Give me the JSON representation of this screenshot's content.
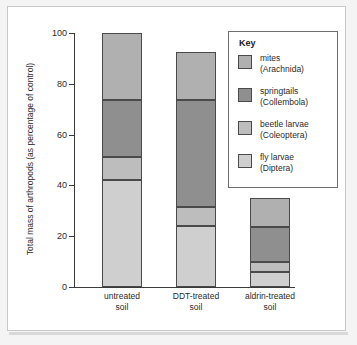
{
  "chart_data": {
    "type": "bar",
    "stacked": true,
    "title": "",
    "xlabel": "",
    "ylabel": "Total mass of arthropods (as percentage of control)",
    "ylim": [
      0,
      100
    ],
    "yticks": [
      0,
      20,
      40,
      60,
      80,
      100
    ],
    "ytick_labels": [
      "0",
      "20",
      "40",
      "60",
      "80",
      "100"
    ],
    "grid": false,
    "legend_position": "inside-top-right",
    "legend_title": "Key",
    "categories": [
      "untreated soil",
      "DDT-treated soil",
      "aldrin-treated soil"
    ],
    "category_lines": [
      [
        "untreated",
        "soil"
      ],
      [
        "DDT-treated",
        "soil"
      ],
      [
        "aldrin-treated",
        "soil"
      ]
    ],
    "stack_order_bottom_to_top": [
      "fly larvae (Diptera)",
      "beetle larvae (Coleoptera)",
      "springtails (Collembola)",
      "mites (Arachnida)"
    ],
    "series": [
      {
        "name": "fly larvae (Diptera)",
        "label": "fly larvae",
        "sublabel": "(Diptera)",
        "color": "#cfcfcf",
        "values": [
          42,
          24,
          6
        ]
      },
      {
        "name": "beetle larvae (Coleoptera)",
        "label": "beetle larvae",
        "sublabel": "(Coleoptera)",
        "color": "#bdbdbd",
        "values": [
          9,
          7.5,
          4
        ]
      },
      {
        "name": "springtails (Collembola)",
        "label": "springtails",
        "sublabel": "(Collembola)",
        "color": "#8f8f8f",
        "values": [
          22.5,
          42,
          13.5
        ]
      },
      {
        "name": "mites (Arachnida)",
        "label": "mites",
        "sublabel": "(Arachnida)",
        "color": "#b0b0b0",
        "values": [
          26.5,
          19,
          11.5
        ]
      }
    ],
    "totals": [
      100,
      92.5,
      35
    ],
    "cumulative_tops": [
      [
        42,
        51,
        73.5,
        100
      ],
      [
        24,
        31.5,
        73.5,
        92.5
      ],
      [
        6,
        10,
        23.5,
        35
      ]
    ]
  },
  "legend": {
    "title": "Key",
    "entries": [
      {
        "label": "mites",
        "sublabel": "(Arachnida)",
        "color": "#b0b0b0"
      },
      {
        "label": "springtails",
        "sublabel": "(Collembola)",
        "color": "#8f8f8f"
      },
      {
        "label": "beetle larvae",
        "sublabel": "(Coleoptera)",
        "color": "#bdbdbd"
      },
      {
        "label": "fly larvae",
        "sublabel": "(Diptera)",
        "color": "#cfcfcf"
      }
    ]
  },
  "colors": {
    "axis": "#3a3a3a",
    "segment_outline": "#4a4a4a",
    "panel_background": "#ffffff",
    "figure_background": "#f4f4f4",
    "text": "#2b2b2b"
  }
}
